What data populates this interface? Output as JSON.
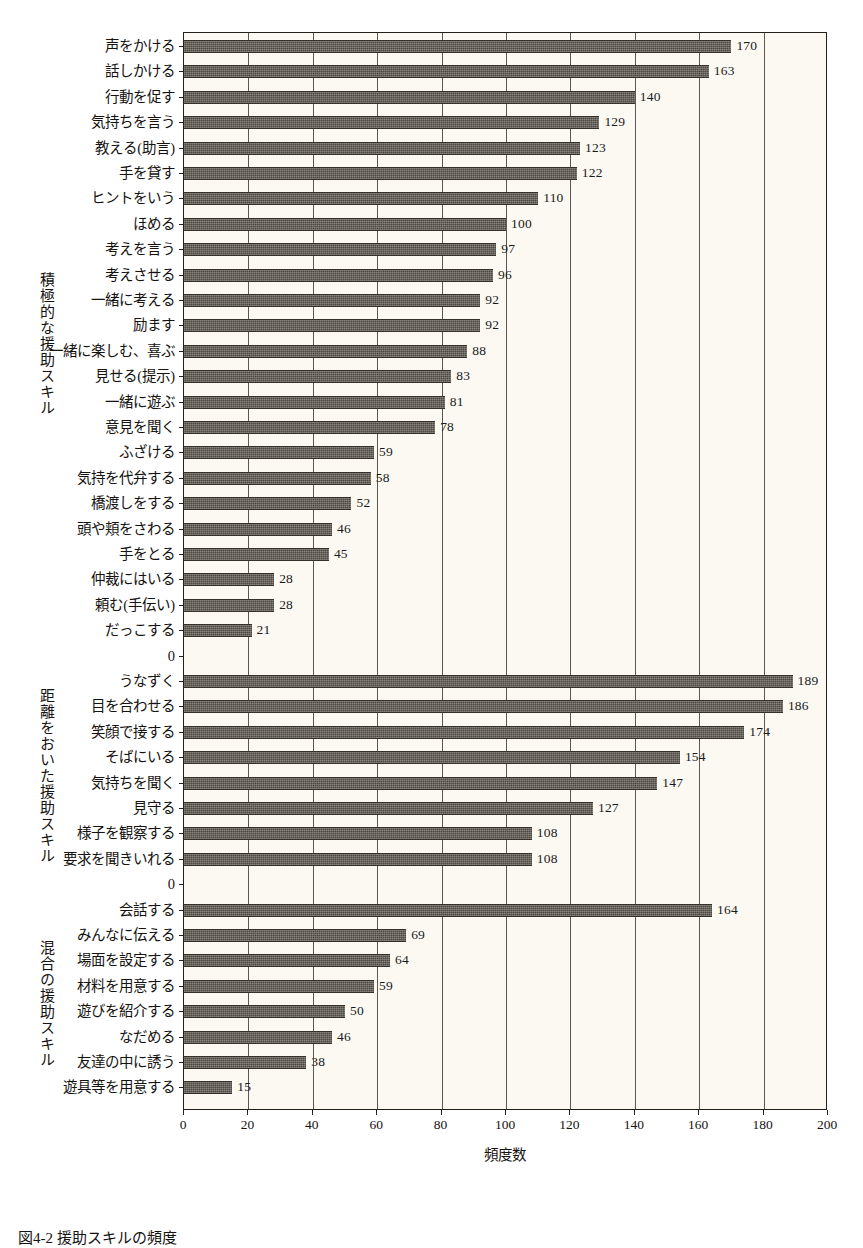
{
  "figure": {
    "caption": "図4-2 援助スキルの頻度",
    "xaxis_title": "頻度数",
    "bar_color": "#4c473f",
    "plot_background": "#fbf9f2",
    "axis_color": "#23201c"
  },
  "chart_data": {
    "type": "bar",
    "orientation": "horizontal",
    "title": "",
    "xlabel": "頻度数",
    "ylabel": "",
    "xlim": [
      0,
      200
    ],
    "xticks": [
      0,
      20,
      40,
      60,
      80,
      100,
      120,
      140,
      160,
      180,
      200
    ],
    "grid": true,
    "legend": null,
    "group_labels": [
      "積極的な援助スキル",
      "距離をおいた援助スキル",
      "混合の援助スキル"
    ],
    "separator_label": "0",
    "groups": [
      {
        "name": "積極的な援助スキル",
        "categories": [
          "声をかける",
          "話しかける",
          "行動を促す",
          "気持ちを言う",
          "教える(助言)",
          "手を貸す",
          "ヒントをいう",
          "ほめる",
          "考えを言う",
          "考えさせる",
          "一緒に考える",
          "励ます",
          "一緒に楽しむ、喜ぶ",
          "見せる(提示)",
          "一緒に遊ぶ",
          "意見を聞く",
          "ふざける",
          "気持を代弁する",
          "橋渡しをする",
          "頭や頬をさわる",
          "手をとる",
          "仲裁にはいる",
          "頼む(手伝い)",
          "だっこする"
        ],
        "values": [
          170,
          163,
          140,
          129,
          123,
          122,
          110,
          100,
          97,
          96,
          92,
          92,
          88,
          83,
          81,
          78,
          59,
          58,
          52,
          46,
          45,
          28,
          28,
          21
        ]
      },
      {
        "name": "距離をおいた援助スキル",
        "categories": [
          "うなずく",
          "目を合わせる",
          "笑顔で接する",
          "そばにいる",
          "気持ちを聞く",
          "見守る",
          "様子を観察する",
          "要求を聞きいれる"
        ],
        "values": [
          189,
          186,
          174,
          154,
          147,
          127,
          108,
          108
        ]
      },
      {
        "name": "混合の援助スキル",
        "categories": [
          "会話する",
          "みんなに伝える",
          "場面を設定する",
          "材料を用意する",
          "遊びを紹介する",
          "なだめる",
          "友達の中に誘う",
          "遊具等を用意する"
        ],
        "values": [
          164,
          69,
          64,
          59,
          50,
          46,
          38,
          15
        ]
      }
    ]
  }
}
